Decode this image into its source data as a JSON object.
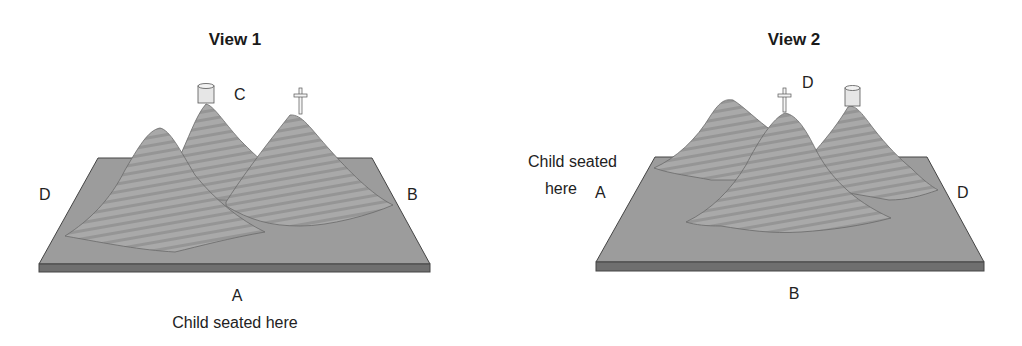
{
  "figure": {
    "views": [
      {
        "title": "View 1",
        "labels": {
          "near": "A",
          "right": "B",
          "far": "C",
          "left": "D"
        },
        "observer_caption": "Child seated here",
        "observer_position": "A",
        "landmarks": [
          {
            "name": "cylinder-house",
            "mountain": "back-center"
          },
          {
            "name": "cross",
            "mountain": "right"
          },
          {
            "name": "plain",
            "mountain": "front-left"
          }
        ]
      },
      {
        "title": "View 2",
        "labels": {
          "left": "A",
          "near": "B",
          "far": "D",
          "right": "D"
        },
        "observer_caption_line1": "Child seated",
        "observer_caption_line2": "here",
        "observer_position": "A",
        "landmarks": [
          {
            "name": "plain",
            "mountain": "back-left"
          },
          {
            "name": "cross",
            "mountain": "front-center"
          },
          {
            "name": "cylinder-house",
            "mountain": "right"
          }
        ]
      }
    ],
    "colors": {
      "board_top": "#9a9a9a",
      "board_edge": "#6e6e6e",
      "mountain_fill": "#a8a8a8",
      "mountain_stripe": "#8c8c8c",
      "outline": "#4a4a4a",
      "object_fill": "#e8e8e8"
    }
  }
}
